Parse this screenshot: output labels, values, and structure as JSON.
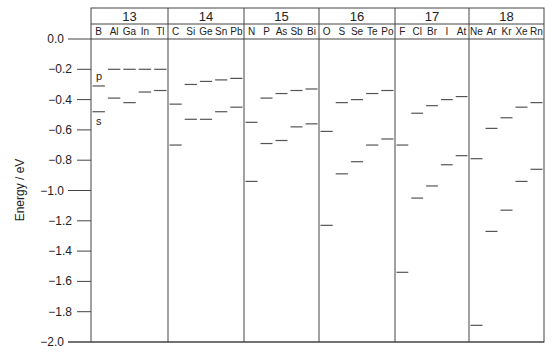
{
  "chart_data": {
    "type": "scatter",
    "subtype": "energy-level diagram",
    "title": "",
    "xlabel": "",
    "ylabel": "Energy / eV",
    "ylim": [
      -2.0,
      0.0
    ],
    "yticks": [
      0.0,
      -0.2,
      -0.4,
      -0.6,
      -0.8,
      -1.0,
      -1.2,
      -1.4,
      -1.6,
      -1.8,
      -2.0
    ],
    "ytick_labels": [
      "0.0",
      "−0.2",
      "−0.4",
      "−0.6",
      "−0.8",
      "−1.0",
      "−1.2",
      "−1.4",
      "−1.6",
      "−1.8",
      "−2.0"
    ],
    "grid": false,
    "legend": null,
    "annotations": [
      {
        "text": "p",
        "group": "13",
        "element": "B",
        "level": "p"
      },
      {
        "text": "s",
        "group": "13",
        "element": "B",
        "level": "s"
      }
    ],
    "groups": [
      {
        "name": "13",
        "elements": [
          "B",
          "Al",
          "Ga",
          "In",
          "Tl"
        ],
        "p": [
          -0.31,
          -0.2,
          -0.2,
          -0.2,
          -0.2
        ],
        "s": [
          -0.48,
          -0.39,
          -0.42,
          -0.35,
          -0.34
        ]
      },
      {
        "name": "14",
        "elements": [
          "C",
          "Si",
          "Ge",
          "Sn",
          "Pb"
        ],
        "p": [
          -0.43,
          -0.3,
          -0.28,
          -0.27,
          -0.26
        ],
        "s": [
          -0.7,
          -0.53,
          -0.53,
          -0.48,
          -0.45
        ]
      },
      {
        "name": "15",
        "elements": [
          "N",
          "P",
          "As",
          "Sb",
          "Bi"
        ],
        "p": [
          -0.55,
          -0.39,
          -0.36,
          -0.34,
          -0.33
        ],
        "s": [
          -0.94,
          -0.69,
          -0.67,
          -0.58,
          -0.56
        ]
      },
      {
        "name": "16",
        "elements": [
          "O",
          "S",
          "Se",
          "Te",
          "Po"
        ],
        "p": [
          -0.61,
          -0.42,
          -0.4,
          -0.36,
          -0.34
        ],
        "s": [
          -1.23,
          -0.89,
          -0.81,
          -0.7,
          -0.66
        ]
      },
      {
        "name": "17",
        "elements": [
          "F",
          "Cl",
          "Br",
          "I",
          "At"
        ],
        "p": [
          -0.7,
          -0.49,
          -0.44,
          -0.4,
          -0.38
        ],
        "s": [
          -1.54,
          -1.05,
          -0.97,
          -0.83,
          -0.77
        ]
      },
      {
        "name": "18",
        "elements": [
          "Ne",
          "Ar",
          "Kr",
          "Xe",
          "Rn"
        ],
        "p": [
          -0.79,
          -0.59,
          -0.52,
          -0.45,
          -0.42
        ],
        "s": [
          -1.89,
          -1.27,
          -1.13,
          -0.94,
          -0.86
        ]
      }
    ]
  },
  "style": {
    "line_color": "#555555",
    "frame_color": "#444444",
    "text_color": "#222222"
  }
}
